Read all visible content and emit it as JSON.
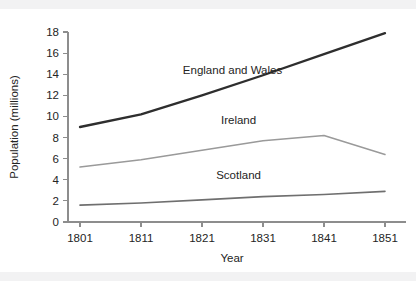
{
  "chart_data": {
    "type": "line",
    "title": "",
    "xlabel": "Year",
    "ylabel": "Population (millions)",
    "x": [
      1801,
      1811,
      1821,
      1831,
      1841,
      1851
    ],
    "xtick_labels": [
      "1801",
      "1811",
      "1821",
      "1831",
      "1841",
      "1851"
    ],
    "ytick_labels": [
      "0",
      "2",
      "4",
      "6",
      "8",
      "10",
      "12",
      "14",
      "16",
      "18"
    ],
    "ytick_values": [
      0,
      2,
      4,
      6,
      8,
      10,
      12,
      14,
      16,
      18
    ],
    "xlim": [
      1801,
      1851
    ],
    "ylim": [
      0,
      18
    ],
    "grid": false,
    "legend_position": "inline-labels",
    "series": [
      {
        "name": "England and Wales",
        "values": [
          9.0,
          10.2,
          12.0,
          13.9,
          15.9,
          17.9
        ],
        "color": "#2e2e2e",
        "width": 2.3,
        "label_x": 1826,
        "label_y": 14.0
      },
      {
        "name": "Ireland",
        "values": [
          5.2,
          5.9,
          6.8,
          7.7,
          8.2,
          6.4
        ],
        "color": "#9a9a9a",
        "width": 1.5,
        "label_x": 1827,
        "label_y": 9.3
      },
      {
        "name": "Scotland",
        "values": [
          1.6,
          1.8,
          2.1,
          2.4,
          2.6,
          2.9
        ],
        "color": "#6f6f6f",
        "width": 1.6,
        "label_x": 1827,
        "label_y": 4.1
      }
    ]
  },
  "figure": {
    "background": "#ffffff",
    "band_color": "#f2f2f3",
    "axis_color": "#8d8d8d",
    "text_color": "#242424"
  }
}
